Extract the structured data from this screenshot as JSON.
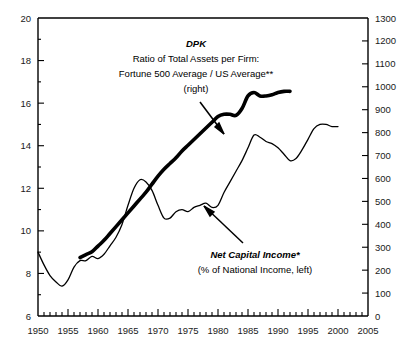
{
  "chart_data": {
    "type": "line",
    "title": "",
    "xlabel": "",
    "ylabel": "",
    "xlim": [
      1950,
      2005
    ],
    "grid": false,
    "legend_position": "inline-annotations",
    "x_ticks": [
      1950,
      1955,
      1960,
      1965,
      1970,
      1975,
      1980,
      1985,
      1990,
      1995,
      2000,
      2005
    ],
    "x_minor_tick_interval": 1,
    "left_axis": {
      "label": "Net Capital Income (% of National Income, left)",
      "ylim": [
        6,
        20
      ],
      "ticks": [
        6,
        8,
        10,
        12,
        14,
        16,
        18,
        20
      ],
      "minor_tick_interval": 1
    },
    "right_axis": {
      "label": "DPK Ratio of Total Assets per Firm: Fortune 500 Average / US Average (right)",
      "ylim": [
        0,
        1300
      ],
      "ticks": [
        0,
        100,
        200,
        300,
        400,
        500,
        600,
        700,
        800,
        900,
        1000,
        1100,
        1200,
        1300
      ],
      "minor_tick_interval": 100
    },
    "series": [
      {
        "name": "Net Capital Income",
        "axis": "left",
        "style": "thin",
        "color": "#000000",
        "x": [
          1950,
          1951,
          1952,
          1953,
          1954,
          1955,
          1956,
          1957,
          1958,
          1959,
          1960,
          1961,
          1962,
          1963,
          1964,
          1965,
          1966,
          1967,
          1968,
          1969,
          1970,
          1971,
          1972,
          1973,
          1974,
          1975,
          1976,
          1977,
          1978,
          1979,
          1980,
          1981,
          1982,
          1983,
          1984,
          1985,
          1986,
          1987,
          1988,
          1989,
          1990,
          1991,
          1992,
          1993,
          1994,
          1995,
          1996,
          1997,
          1998,
          1999,
          2000
        ],
        "y": [
          9.0,
          8.4,
          7.9,
          7.6,
          7.4,
          7.7,
          8.3,
          8.6,
          8.6,
          8.8,
          8.7,
          8.9,
          9.3,
          9.7,
          10.3,
          11.2,
          12.0,
          12.4,
          12.3,
          11.9,
          11.2,
          10.6,
          10.6,
          10.9,
          11.0,
          10.9,
          11.1,
          11.2,
          11.3,
          11.1,
          11.2,
          11.8,
          12.3,
          12.8,
          13.3,
          13.9,
          14.5,
          14.4,
          14.2,
          14.1,
          13.9,
          13.6,
          13.3,
          13.4,
          13.8,
          14.3,
          14.8,
          15.0,
          15.0,
          14.9,
          14.9
        ]
      },
      {
        "name": "DPK Ratio of Total Assets per Firm",
        "axis": "right",
        "style": "thick",
        "color": "#000000",
        "x": [
          1957,
          1958,
          1959,
          1960,
          1961,
          1962,
          1963,
          1964,
          1965,
          1966,
          1967,
          1968,
          1969,
          1970,
          1971,
          1972,
          1973,
          1974,
          1975,
          1976,
          1977,
          1978,
          1979,
          1980,
          1981,
          1982,
          1983,
          1984,
          1985,
          1986,
          1987,
          1988,
          1989,
          1990,
          1991,
          1992
        ],
        "y": [
          255,
          268,
          280,
          305,
          330,
          360,
          390,
          420,
          450,
          480,
          510,
          540,
          575,
          610,
          640,
          665,
          690,
          720,
          745,
          770,
          795,
          820,
          845,
          870,
          880,
          880,
          875,
          905,
          960,
          975,
          960,
          960,
          965,
          975,
          980,
          980
        ]
      }
    ],
    "annotations": [
      {
        "name": "dpk-annotation",
        "lines": [
          "DPK",
          "Ratio of Total Assets per Firm:",
          "Fortune 500 Average /  US Average**",
          "(right)"
        ]
      },
      {
        "name": "net-capital-income-annotation",
        "lines": [
          "Net Capital Income*",
          "(% of National Income, left)"
        ]
      }
    ]
  },
  "colors": {
    "background": "#ffffff",
    "axis": "#000000",
    "text": "#1a1a1a",
    "series": "#000000"
  }
}
